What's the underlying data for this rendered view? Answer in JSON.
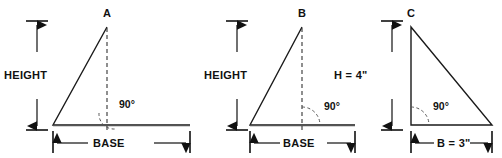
{
  "figure": {
    "background_color": "#ffffff",
    "line_color": "#1a1a1a",
    "text_color": "#111111",
    "width": 502,
    "height": 158
  },
  "diagrams": [
    {
      "id": "triangle-a",
      "vertex_label": "A",
      "height_label": "HEIGHT",
      "base_label": "BASE",
      "angle_label": "90°",
      "shape": "acute-triangle-with-altitude"
    },
    {
      "id": "triangle-b",
      "vertex_label": "B",
      "height_label": "HEIGHT",
      "base_label": "BASE",
      "angle_label": "90°",
      "shape": "isosceles-triangle-with-altitude"
    },
    {
      "id": "triangle-c",
      "vertex_label": "C",
      "height_label": "H = 4\"",
      "base_label": "B = 3\"",
      "angle_label": "90°",
      "shape": "right-triangle"
    }
  ]
}
